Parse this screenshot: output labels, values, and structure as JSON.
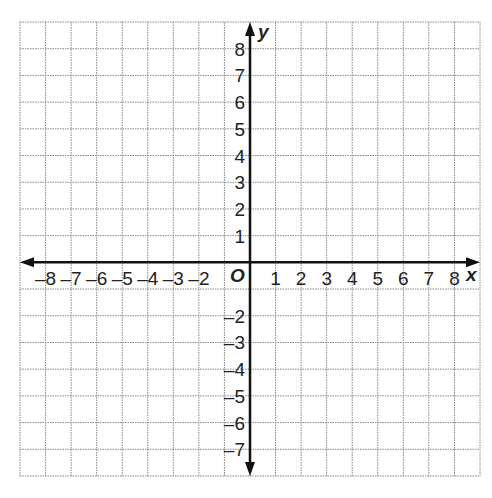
{
  "diagram": {
    "type": "coordinate-plane",
    "x_axis": {
      "name": "x",
      "min": -9,
      "max": 9,
      "labels": [
        "-8",
        "-7",
        "-6",
        "-5",
        "-4",
        "-3",
        "-2",
        "1",
        "2",
        "3",
        "4",
        "5",
        "6",
        "7",
        "8"
      ]
    },
    "y_axis": {
      "name": "y",
      "min": -8,
      "max": 9,
      "labels": [
        "8",
        "7",
        "6",
        "5",
        "4",
        "3",
        "2",
        "1",
        "-2",
        "-3",
        "-4",
        "-5",
        "-6",
        "-7"
      ]
    },
    "origin_label": "O",
    "grid": {
      "columns": 18,
      "rows": 17,
      "line_style": "dotted",
      "color": "#888888"
    },
    "axis_color": "#111111"
  }
}
